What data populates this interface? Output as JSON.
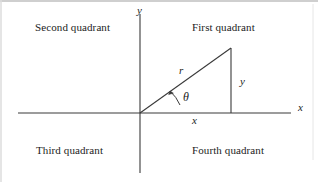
{
  "figure": {
    "background_color": "#ffffff",
    "stroke_color": "#3a3a3a",
    "text_color": "#1c1c1c",
    "width": 318,
    "height": 182
  },
  "axes": {
    "x_axis": {
      "label": "x",
      "line": {
        "x1": 18,
        "y1": 113,
        "x2": 291,
        "y2": 113
      }
    },
    "y_axis": {
      "label": "y",
      "line": {
        "x1": 140,
        "y1": 14,
        "x2": 140,
        "y2": 173
      }
    },
    "origin": {
      "x": 140,
      "y": 113
    }
  },
  "quadrants": [
    {
      "name": "first-quadrant",
      "label": "First quadrant"
    },
    {
      "name": "second-quadrant",
      "label": "Second quadrant"
    },
    {
      "name": "third-quadrant",
      "label": "Third quadrant"
    },
    {
      "name": "fourth-quadrant",
      "label": "Fourth quadrant"
    }
  ],
  "triangle": {
    "vertices": {
      "origin": {
        "x": 140,
        "y": 113
      },
      "apex": {
        "x": 231,
        "y": 48
      },
      "foot": {
        "x": 231,
        "y": 113
      }
    },
    "sides": {
      "hypotenuse_label": "r",
      "vertical_label": "y",
      "horizontal_label": "x"
    },
    "angle": {
      "symbol": "θ",
      "name": "theta",
      "arc_radius": 38
    }
  },
  "border": {
    "top_edge_color": "#cfcfcf",
    "left_edge_color": "#d9d9d9"
  }
}
